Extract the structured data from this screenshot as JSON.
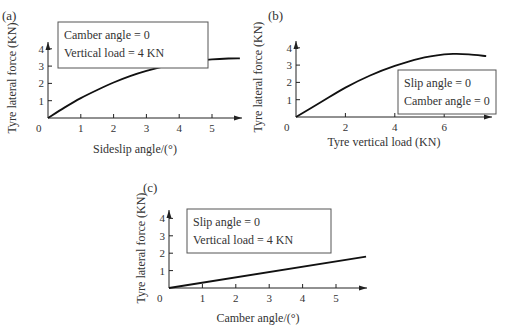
{
  "chart_data": [
    {
      "panel": "(a)",
      "type": "line",
      "title": "",
      "xlabel": "Sideslip angle/(°)",
      "ylabel": "Tyre lateral force (KN)",
      "origin_label": "0",
      "xticks": [
        1,
        2,
        3,
        4,
        5
      ],
      "yticks": [
        1,
        2,
        3,
        4
      ],
      "xlim": [
        0,
        5.9
      ],
      "ylim": [
        0,
        4.4
      ],
      "grid": false,
      "legend": [
        "Camber angle = 0",
        "Vertical load = 4 KN"
      ],
      "legend_position": "upper left",
      "x": [
        0,
        0.5,
        1,
        1.5,
        2,
        2.5,
        3,
        3.5,
        4,
        4.5,
        5,
        5.5,
        5.85
      ],
      "values": [
        0,
        0.6,
        1.15,
        1.62,
        2.05,
        2.42,
        2.72,
        2.97,
        3.16,
        3.3,
        3.39,
        3.44,
        3.45
      ]
    },
    {
      "panel": "(b)",
      "type": "line",
      "title": "",
      "xlabel": "Tyre vertical load (KN)",
      "ylabel": "Tyre lateral force (KN)",
      "origin_label": "0",
      "xticks": [
        2,
        4,
        6
      ],
      "yticks": [
        1,
        2,
        3,
        4
      ],
      "xlim": [
        0,
        7.8
      ],
      "ylim": [
        0,
        4.4
      ],
      "grid": false,
      "legend": [
        "Slip angle = 0",
        "Camber angle = 0"
      ],
      "legend_position": "lower right",
      "x": [
        0,
        1,
        2,
        3,
        4,
        5,
        6,
        6.5,
        7,
        7.7
      ],
      "values": [
        0,
        0.85,
        1.7,
        2.4,
        2.95,
        3.38,
        3.62,
        3.65,
        3.62,
        3.52
      ]
    },
    {
      "panel": "(c)",
      "type": "line",
      "title": "",
      "xlabel": "Camber angle/(°)",
      "ylabel": "Tyre lateral force (KN)",
      "origin_label": "0",
      "xticks": [
        1,
        2,
        3,
        4,
        5
      ],
      "yticks": [
        1,
        2,
        3,
        4
      ],
      "xlim": [
        0,
        5.9
      ],
      "ylim": [
        0,
        4.4
      ],
      "grid": false,
      "legend": [
        "Slip angle = 0",
        "Vertical load = 4 KN"
      ],
      "legend_position": "upper left",
      "x": [
        0,
        5.9
      ],
      "values": [
        0,
        1.8
      ]
    }
  ]
}
